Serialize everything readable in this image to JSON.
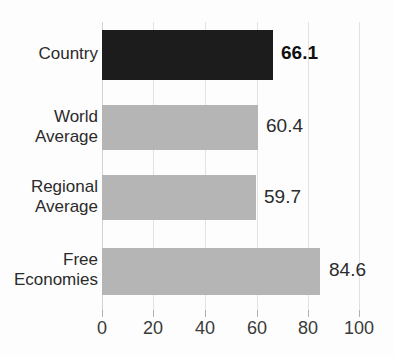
{
  "chart_data": {
    "type": "bar",
    "orientation": "horizontal",
    "title_visible_fragment": "",
    "categories": [
      "Country",
      "World Average",
      "Regional Average",
      "Free Economies"
    ],
    "values": [
      66.1,
      60.4,
      59.7,
      84.6
    ],
    "value_labels": [
      "66.1",
      "60.4",
      "59.7",
      "84.6"
    ],
    "series": [
      {
        "name": "Score",
        "values": [
          66.1,
          60.4,
          59.7,
          84.6
        ]
      }
    ],
    "highlight_index": 0,
    "xlabel": "",
    "ylabel": "",
    "xlim": [
      0,
      100
    ],
    "xticks": [
      0,
      20,
      40,
      60,
      80,
      100
    ],
    "xtick_labels": [
      "0",
      "20",
      "40",
      "60",
      "80",
      "100"
    ],
    "grid": true,
    "grid_axis": "x",
    "legend": false,
    "colors": {
      "highlight_bar": "#1c1c1c",
      "normal_bar": "#b5b5b5",
      "gridline": "#e2e2e2",
      "text": "#2b2b2b",
      "background": "#fdfdfd"
    }
  },
  "category_label_lines": [
    [
      "Country"
    ],
    [
      "World",
      "Average"
    ],
    [
      "Regional",
      "Average"
    ],
    [
      "Free",
      "Economies"
    ]
  ],
  "labels": {
    "cat0_line0": "Country",
    "cat1_line0": "World",
    "cat1_line1": "Average",
    "cat2_line0": "Regional",
    "cat2_line1": "Average",
    "cat3_line0": "Free",
    "cat3_line1": "Economies"
  },
  "values": {
    "v0": "66.1",
    "v1": "60.4",
    "v2": "59.7",
    "v3": "84.6"
  },
  "axis": {
    "t0": "0",
    "t1": "20",
    "t2": "40",
    "t3": "60",
    "t4": "80",
    "t5": "100"
  }
}
